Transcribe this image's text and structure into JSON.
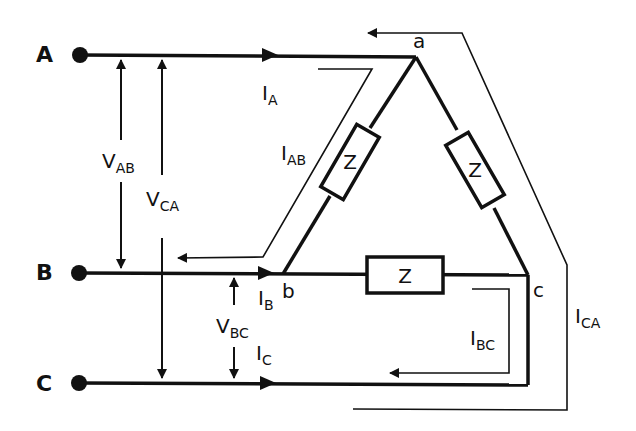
{
  "diagram": {
    "terminals": [
      {
        "id": "A",
        "label": "A"
      },
      {
        "id": "B",
        "label": "B"
      },
      {
        "id": "C",
        "label": "C"
      }
    ],
    "nodes": [
      {
        "id": "a",
        "label": "a"
      },
      {
        "id": "b",
        "label": "b"
      },
      {
        "id": "c",
        "label": "c"
      }
    ],
    "impedances": [
      {
        "id": "Zab",
        "label": "Z"
      },
      {
        "id": "Zca",
        "label": "Z"
      },
      {
        "id": "Zbc",
        "label": "Z"
      }
    ],
    "voltages": {
      "vab": {
        "main": "V",
        "sub": "AB"
      },
      "vca": {
        "main": "V",
        "sub": "CA"
      },
      "vbc": {
        "main": "V",
        "sub": "BC"
      }
    },
    "currents": {
      "ia": {
        "main": "I",
        "sub": "A"
      },
      "ib": {
        "main": "I",
        "sub": "B"
      },
      "ic": {
        "main": "I",
        "sub": "C"
      },
      "iab": {
        "main": "I",
        "sub": "AB"
      },
      "ibc": {
        "main": "I",
        "sub": "BC"
      },
      "ica": {
        "main": "I",
        "sub": "CA"
      }
    },
    "colors": {
      "line": "#111111",
      "background": "#ffffff"
    }
  }
}
